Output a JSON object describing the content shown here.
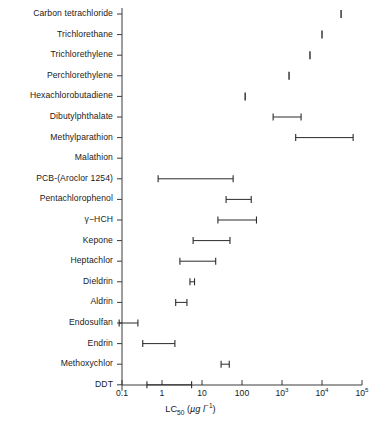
{
  "chart_data": {
    "type": "bar",
    "orientation": "horizontal",
    "subtype": "range-interval",
    "title": "",
    "xlabel": "LC50 (µg l⁻¹)",
    "xlabel_parts": {
      "base": "LC",
      "subscript": "50",
      "unit_open": " (",
      "unit_mu": "µ",
      "unit_g": "g l",
      "unit_sup": "−1",
      "unit_close": ")"
    },
    "ylabel": "",
    "xscale": "log",
    "xlim": [
      0.1,
      100000
    ],
    "grid": false,
    "legend": null,
    "xticks": [
      {
        "value": 0.1,
        "label": "0.1",
        "mantissa": null,
        "exponent": null
      },
      {
        "value": 1,
        "label": "1",
        "mantissa": null,
        "exponent": null
      },
      {
        "value": 10,
        "label": "10",
        "mantissa": null,
        "exponent": null
      },
      {
        "value": 100,
        "label": "100",
        "mantissa": null,
        "exponent": null
      },
      {
        "value": 1000,
        "label": "10",
        "mantissa": "10",
        "exponent": "3"
      },
      {
        "value": 10000,
        "label": "10",
        "mantissa": "10",
        "exponent": "4"
      },
      {
        "value": 100000,
        "label": "10",
        "mantissa": "10",
        "exponent": "5"
      }
    ],
    "categories": [
      "Carbon tetrachloride",
      "Trichlorethane",
      "Trichlorethylene",
      "Perchlorethylene",
      "Hexachlorobutadiene",
      "Dibutylphthalate",
      "Methylparathion",
      "Malathion",
      "PCB-(Aroclor 1254)",
      "Pentachlorophenol",
      "γ−HCH",
      "Kepone",
      "Heptachlor",
      "Dieldrin",
      "Aldrin",
      "Endosulfan",
      "Endrin",
      "Methoxychlor",
      "DDT"
    ],
    "intervals": [
      {
        "category": "Carbon tetrachloride",
        "low": 30000,
        "high": 30000,
        "kind": "point"
      },
      {
        "category": "Trichlorethane",
        "low": 10000,
        "high": 10000,
        "kind": "point"
      },
      {
        "category": "Trichlorethylene",
        "low": 5000,
        "high": 5000,
        "kind": "point"
      },
      {
        "category": "Perchlorethylene",
        "low": 1500,
        "high": 1500,
        "kind": "point"
      },
      {
        "category": "Hexachlorobutadiene",
        "low": 120,
        "high": 120,
        "kind": "point"
      },
      {
        "category": "Dibutylphthalate",
        "low": 600,
        "high": 3000,
        "kind": "range"
      },
      {
        "category": "Methylparathion",
        "low": 2200,
        "high": 60000,
        "kind": "range"
      },
      {
        "category": "Malathion",
        "low": null,
        "high": null,
        "kind": "none"
      },
      {
        "category": "PCB-(Aroclor 1254)",
        "low": 0.8,
        "high": 60,
        "kind": "range"
      },
      {
        "category": "Pentachlorophenol",
        "low": 40,
        "high": 170,
        "kind": "range"
      },
      {
        "category": "γ−HCH",
        "low": 25,
        "high": 230,
        "kind": "range"
      },
      {
        "category": "Kepone",
        "low": 6,
        "high": 50,
        "kind": "range"
      },
      {
        "category": "Heptachlor",
        "low": 2.8,
        "high": 22,
        "kind": "range"
      },
      {
        "category": "Dieldrin",
        "low": 5,
        "high": 6.5,
        "kind": "range"
      },
      {
        "category": "Aldrin",
        "low": 2.2,
        "high": 4.2,
        "kind": "range"
      },
      {
        "category": "Endosulfan",
        "low": 0.085,
        "high": 0.25,
        "kind": "range"
      },
      {
        "category": "Endrin",
        "low": 0.33,
        "high": 2.1,
        "kind": "range"
      },
      {
        "category": "Methoxychlor",
        "low": 30,
        "high": 48,
        "kind": "range"
      },
      {
        "category": "DDT",
        "low": 0.42,
        "high": 5.5,
        "kind": "range"
      }
    ]
  },
  "style": {
    "line_color": "#2b2b2b",
    "axis_color": "#3a3a3a",
    "background": "#ffffff"
  }
}
